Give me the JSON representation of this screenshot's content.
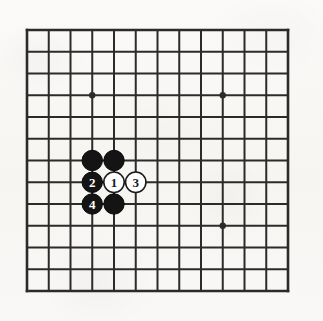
{
  "figure": {
    "kind": "go-board-diagram",
    "title": "",
    "caption": ""
  },
  "board": {
    "columns": 13,
    "rows": 13,
    "origin_x": 27,
    "origin_y": 30,
    "spacing": 21.75,
    "line_color": "#2b2b2b",
    "line_width": 2.0,
    "edge_line_width": 2.6,
    "background_color": "#faf9f7"
  },
  "star_points": [
    {
      "name": "star-point-upper-left",
      "col": 3,
      "row": 3
    },
    {
      "name": "star-point-upper-right",
      "col": 9,
      "row": 3
    },
    {
      "name": "star-point-lower-right",
      "col": 9,
      "row": 9
    }
  ],
  "star_point_radius": 3.2,
  "stone_radius": 10.2,
  "stone_colors": {
    "black_fill": "#141414",
    "black_stroke": "#0a0a0a",
    "black_label": "#ffffff",
    "white_fill": "#ffffff",
    "white_stroke": "#1a1a1a",
    "white_label": "#1a1a1a"
  },
  "stones": [
    {
      "name": "black-stone-upper-left",
      "col": 3,
      "row": 6,
      "color": "black",
      "label": ""
    },
    {
      "name": "black-stone-upper-right",
      "col": 4,
      "row": 6,
      "color": "black",
      "label": ""
    },
    {
      "name": "black-stone-move-2",
      "col": 3,
      "row": 7,
      "color": "black",
      "label": "2"
    },
    {
      "name": "white-stone-move-1",
      "col": 4,
      "row": 7,
      "color": "white",
      "label": "1"
    },
    {
      "name": "white-stone-move-3",
      "col": 5,
      "row": 7,
      "color": "white",
      "label": "3"
    },
    {
      "name": "black-stone-move-4",
      "col": 3,
      "row": 8,
      "color": "black",
      "label": "4"
    },
    {
      "name": "black-stone-lower-right",
      "col": 4,
      "row": 8,
      "color": "black",
      "label": ""
    }
  ],
  "move_sequence": [
    {
      "move": "1",
      "color": "white"
    },
    {
      "move": "2",
      "color": "black"
    },
    {
      "move": "3",
      "color": "white"
    },
    {
      "move": "4",
      "color": "black"
    }
  ]
}
